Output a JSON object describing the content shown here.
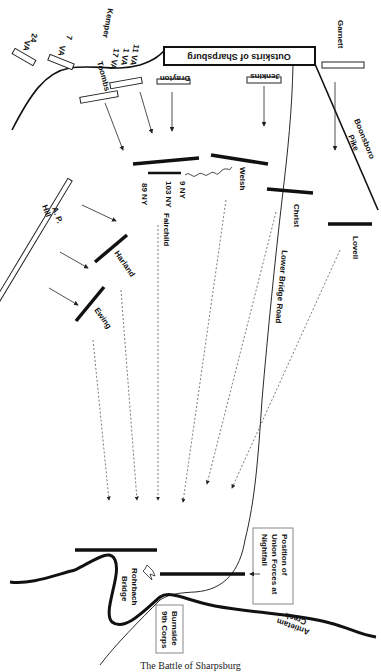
{
  "diagram": {
    "title": "The Battle of Sharpsburg",
    "places": {
      "sharpsburg": "Outskirts of Sharpsburg",
      "pike": [
        "Boonsboro",
        "Pike"
      ],
      "road": "Lower Bridge Road",
      "bridge": [
        "Rohrbach",
        "Bridge"
      ],
      "creek": [
        "Antietam",
        "Creek"
      ]
    },
    "confederate_units": {
      "va24": [
        "24",
        "VA"
      ],
      "va7": [
        "7",
        "VA"
      ],
      "kemper": "Kemper",
      "va_group": [
        "11 VA",
        "1 VA",
        "17 VA"
      ],
      "toombs": "Toombs",
      "drayton": "Drayton",
      "jenkins": "Jenkins",
      "garnett": "Garnett",
      "aphill": [
        "A. P.",
        "Hill"
      ]
    },
    "union_units": {
      "ny89": "89 NY",
      "ny103": "103 NY",
      "ny9": "9 NY",
      "fairchild": "Fairchild",
      "welsh": "Welsh",
      "christ": "Christ",
      "lovell": "Lovell",
      "harland": "Harland",
      "ewing": "Ewing"
    },
    "annotations": {
      "nightfall": [
        "Position of",
        "Union Forces at",
        "Nightfall"
      ],
      "burnside": [
        "Burnside",
        "9th Corps"
      ]
    }
  }
}
